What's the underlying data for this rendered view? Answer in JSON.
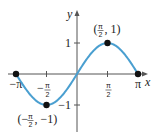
{
  "chart_data": {
    "type": "line",
    "title": "",
    "function": "y = sin(x)",
    "xlabel": "x",
    "ylabel": "y",
    "xlim": [
      -3.14159,
      3.14159
    ],
    "ylim": [
      -1.6,
      1.6
    ],
    "grid": false,
    "curve_color": "#4a9fd0",
    "x_ticks": [
      {
        "value": -3.14159,
        "label": "−π"
      },
      {
        "value": -1.5708,
        "label_num": "π",
        "label_sign": "−",
        "label_den": "2"
      },
      {
        "value": 1.5708,
        "label_num": "π",
        "label_sign": "",
        "label_den": "2"
      },
      {
        "value": 3.14159,
        "label": "π"
      }
    ],
    "y_ticks": [
      {
        "value": 1,
        "label": "1"
      },
      {
        "value": -1,
        "label": "−1"
      }
    ],
    "points": [
      {
        "x": -3.14159,
        "y": 0
      },
      {
        "x": -1.5708,
        "y": -1,
        "annotation": {
          "open": "(−",
          "num": "π",
          "den": "2",
          "rest": ", −1)"
        }
      },
      {
        "x": 1.5708,
        "y": 1,
        "annotation": {
          "open": "(",
          "num": "π",
          "den": "2",
          "rest": ", 1)"
        }
      },
      {
        "x": 3.14159,
        "y": 0
      }
    ]
  }
}
